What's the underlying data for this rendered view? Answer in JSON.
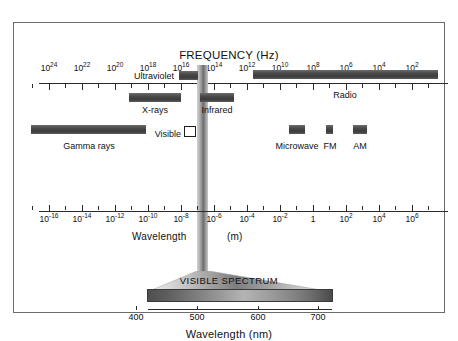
{
  "figure": {
    "kind": "electromagnetic-spectrum-diagram"
  },
  "chart_data": {
    "type": "table",
    "frequency_axis": {
      "label": "FREQUENCY (Hz)",
      "unit": "Hz",
      "tick_labels": [
        "10",
        "10",
        "10",
        "10",
        "10",
        "10",
        "10",
        "10",
        "10",
        "10",
        "10",
        "10",
        "10"
      ],
      "tick_exponents": [
        "24",
        "22",
        "20",
        "18",
        "16",
        "14",
        "12",
        "10",
        "8",
        "6",
        "4",
        "2"
      ],
      "ticks": [
        {
          "base": "10",
          "exp": "24",
          "x": 48
        },
        {
          "base": "10",
          "exp": "22",
          "x": 81
        },
        {
          "base": "10",
          "exp": "20",
          "x": 114
        },
        {
          "base": "10",
          "exp": "18",
          "x": 147
        },
        {
          "base": "10",
          "exp": "16",
          "x": 180
        },
        {
          "base": "10",
          "exp": "14",
          "x": 213
        },
        {
          "base": "10",
          "exp": "12",
          "x": 246
        },
        {
          "base": "10",
          "exp": "10",
          "x": 279
        },
        {
          "base": "10",
          "exp": "8",
          "x": 312
        },
        {
          "base": "10",
          "exp": "6",
          "x": 345
        },
        {
          "base": "10",
          "exp": "4",
          "x": 378
        },
        {
          "base": "10",
          "exp": "2",
          "x": 411
        }
      ],
      "minor_tick_x": [
        31,
        64,
        97,
        130,
        163,
        196,
        229,
        262,
        295,
        328,
        361,
        394,
        427
      ]
    },
    "wavelength_axis": {
      "label_left": "Wavelength",
      "label_right": "(m)",
      "unit": "m",
      "ticks": [
        {
          "base": "10",
          "exp": "-16",
          "x": 48
        },
        {
          "base": "10",
          "exp": "-14",
          "x": 81
        },
        {
          "base": "10",
          "exp": "-12",
          "x": 114
        },
        {
          "base": "10",
          "exp": "-10",
          "x": 147
        },
        {
          "base": "10",
          "exp": "-8",
          "x": 180
        },
        {
          "base": "10",
          "exp": "-6",
          "x": 213
        },
        {
          "base": "10",
          "exp": "-4",
          "x": 246
        },
        {
          "base": "10",
          "exp": "-2",
          "x": 279
        },
        {
          "base": "1",
          "exp": "",
          "x": 312
        },
        {
          "base": "10",
          "exp": "2",
          "x": 345
        },
        {
          "base": "10",
          "exp": "4",
          "x": 378
        },
        {
          "base": "10",
          "exp": "6",
          "x": 411
        }
      ],
      "minor_tick_x": [
        31,
        64,
        97,
        130,
        163,
        196,
        229,
        262,
        295,
        328,
        361,
        394,
        427
      ]
    },
    "bands": [
      {
        "name": "Ultraviolet",
        "x": 178,
        "width": 19,
        "y": 70,
        "label_x": 175,
        "label_y": 70,
        "label_align": "right"
      },
      {
        "name": "Radio",
        "x": 252,
        "width": 185,
        "y": 69,
        "label_x": 344,
        "label_y": 89,
        "label_align": "center"
      },
      {
        "name": "X-rays",
        "x": 128,
        "width": 52,
        "y": 92,
        "label_x": 154,
        "label_y": 104,
        "label_align": "center"
      },
      {
        "name": "Infrared",
        "x": 199,
        "width": 34,
        "y": 92,
        "label_x": 216,
        "label_y": 104,
        "label_align": "center"
      },
      {
        "name": "Gamma rays",
        "x": 30,
        "width": 115,
        "y": 124,
        "label_x": 88,
        "label_y": 140,
        "label_align": "center"
      },
      {
        "name": "Microwave",
        "x": 288,
        "width": 16,
        "y": 124,
        "label_x": 296,
        "label_y": 140,
        "label_align": "center"
      },
      {
        "name": "FM",
        "x": 325,
        "width": 7,
        "y": 124,
        "label_x": 329,
        "label_y": 140,
        "label_align": "center"
      },
      {
        "name": "AM",
        "x": 352,
        "width": 14,
        "y": 124,
        "label_x": 359,
        "label_y": 140,
        "label_align": "center"
      }
    ],
    "visible_marker": {
      "name": "Visible",
      "label_x": 182,
      "label_y": 128,
      "box_x": 183,
      "box_y": 125,
      "box_width": 12,
      "box_height": 11
    },
    "visible_spectrum": {
      "title": "VISIBLE SPECTRUM",
      "axis_label": "Wavelength (nm)",
      "unit": "nm",
      "ticks": [
        {
          "value": "400",
          "x": 135
        },
        {
          "value": "500",
          "x": 196
        },
        {
          "value": "600",
          "x": 257
        },
        {
          "value": "700",
          "x": 317
        }
      ],
      "range_nm": [
        400,
        700
      ]
    },
    "colors": {
      "frame_border": "#6b6b6b",
      "axis": "#2b2b2b",
      "band_fill": "#4a4a4a",
      "text": "#111111",
      "background": "#ffffff"
    }
  }
}
